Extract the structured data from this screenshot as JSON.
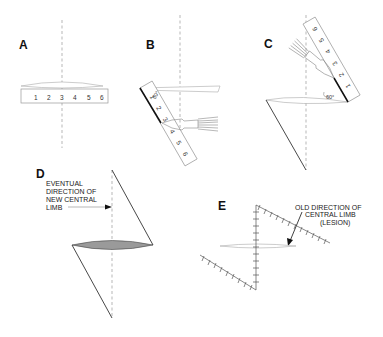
{
  "figure": {
    "panels": [
      {
        "id": "A",
        "label": "A",
        "ruler_numbers": [
          "1",
          "2",
          "3",
          "4",
          "5",
          "6"
        ]
      },
      {
        "id": "B",
        "label": "B",
        "ruler_numbers": [
          "1",
          "2",
          "3",
          "4",
          "5",
          "6"
        ],
        "angle": "60°"
      },
      {
        "id": "C",
        "label": "C",
        "ruler_numbers": [
          "1",
          "2",
          "3",
          "4",
          "5",
          "6"
        ],
        "angle": "60°"
      },
      {
        "id": "D",
        "label": "D",
        "annotation": [
          "EVENTUAL",
          "DIRECTION OF",
          "NEW CENTRAL",
          "LIMB"
        ]
      },
      {
        "id": "E",
        "label": "E",
        "annotation": [
          "OLD DIRECTION OF",
          "CENTRAL LIMB",
          "(LESION)"
        ]
      }
    ]
  }
}
